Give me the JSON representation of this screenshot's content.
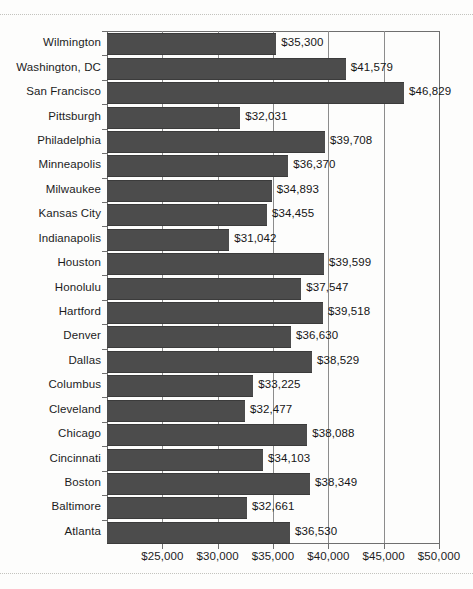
{
  "chart_data": {
    "type": "bar",
    "orientation": "horizontal",
    "title": "",
    "subtitle": "",
    "xlabel": "",
    "ylabel": "",
    "xlim": [
      20000,
      50000
    ],
    "grid": true,
    "legend": false,
    "value_prefix": "$",
    "categories": [
      "Wilmington",
      "Washington, DC",
      "San Francisco",
      "Pittsburgh",
      "Philadelphia",
      "Minneapolis",
      "Milwaukee",
      "Kansas City",
      "Indianapolis",
      "Houston",
      "Honolulu",
      "Hartford",
      "Denver",
      "Dallas",
      "Columbus",
      "Cleveland",
      "Chicago",
      "Cincinnati",
      "Boston",
      "Baltimore",
      "Atlanta"
    ],
    "values": [
      35300,
      41579,
      46829,
      32031,
      39708,
      36370,
      34893,
      34455,
      31042,
      39599,
      37547,
      39518,
      36630,
      38529,
      33225,
      32477,
      38088,
      34103,
      38349,
      32661,
      36530
    ],
    "value_labels": [
      "$35,300",
      "$41,579",
      "$46,829",
      "$32,031",
      "$39,708",
      "$36,370",
      "$34,893",
      "$34,455",
      "$31,042",
      "$39,599",
      "$37,547",
      "$39,518",
      "$36,630",
      "$38,529",
      "$33,225",
      "$32,477",
      "$38,088",
      "$34,103",
      "$38,349",
      "$32,661",
      "$36,530"
    ],
    "xticks": [
      25000,
      30000,
      35000,
      40000,
      45000,
      50000
    ],
    "xtick_labels": [
      "$25,000",
      "$30,000",
      "$35,000",
      "$40,000",
      "$45,000",
      "$50,000"
    ],
    "colors": {
      "bar": "#4c4c4c",
      "axis": "#6f6f6f",
      "grid": "#8c8c8c",
      "text": "#1c1c1c",
      "background": "#fdfdfc"
    }
  }
}
